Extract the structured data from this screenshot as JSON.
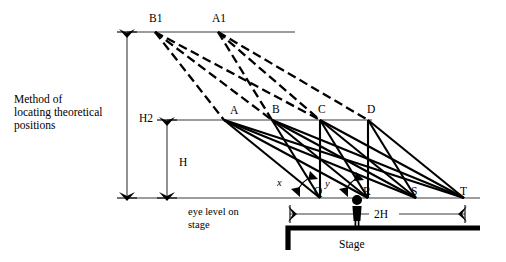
{
  "figure": {
    "caption_lines": [
      "Method of",
      "locating theoretical",
      "positions"
    ],
    "eye_level_lines": [
      "eye level on",
      "stage"
    ],
    "stage_label": "Stage",
    "dimensions": {
      "h2": "H2",
      "h": "H",
      "two_h": "2H"
    },
    "angles": {
      "x": "x",
      "y": "y"
    },
    "source_points": [
      {
        "id": "B1",
        "label": "B1",
        "x": 155,
        "y": 32
      },
      {
        "id": "A1",
        "label": "A1",
        "x": 218,
        "y": 32
      }
    ],
    "mid_points": [
      {
        "id": "A",
        "label": "A",
        "x": 224,
        "y": 120
      },
      {
        "id": "B",
        "label": "B",
        "x": 272,
        "y": 120
      },
      {
        "id": "C",
        "label": "C",
        "x": 320,
        "y": 120
      },
      {
        "id": "D",
        "label": "D",
        "x": 368,
        "y": 120
      }
    ],
    "eye_points": [
      {
        "id": "Q",
        "label": "Q",
        "x": 320,
        "y": 198
      },
      {
        "id": "R",
        "label": "R",
        "x": 368,
        "y": 198
      },
      {
        "id": "S",
        "label": "S",
        "x": 416,
        "y": 198
      },
      {
        "id": "T",
        "label": "T",
        "x": 464,
        "y": 198
      }
    ],
    "dashed_connections": [
      {
        "from": "B1",
        "to": "A"
      },
      {
        "from": "B1",
        "to": "B"
      },
      {
        "from": "B1",
        "to": "C"
      },
      {
        "from": "A1",
        "to": "B"
      },
      {
        "from": "A1",
        "to": "C"
      },
      {
        "from": "A1",
        "to": "D"
      }
    ],
    "solid_connections": [
      {
        "from": "A",
        "to": "Q"
      },
      {
        "from": "A",
        "to": "R"
      },
      {
        "from": "A",
        "to": "S"
      },
      {
        "from": "A",
        "to": "T"
      },
      {
        "from": "B",
        "to": "Q"
      },
      {
        "from": "B",
        "to": "R"
      },
      {
        "from": "B",
        "to": "S"
      },
      {
        "from": "B",
        "to": "T"
      },
      {
        "from": "C",
        "to": "Q"
      },
      {
        "from": "C",
        "to": "R"
      },
      {
        "from": "C",
        "to": "S"
      },
      {
        "from": "C",
        "to": "T"
      },
      {
        "from": "D",
        "to": "Q"
      },
      {
        "from": "D",
        "to": "R"
      },
      {
        "from": "D",
        "to": "S"
      },
      {
        "from": "D",
        "to": "T"
      }
    ],
    "levels": {
      "top_line_y": 32,
      "mid_line_y": 120,
      "eye_line_y": 198,
      "stage_top_y": 228,
      "stage_bottom_y": 250
    },
    "colors": {
      "ink": "#000000",
      "rule": "#3a3a3a",
      "background": "#ffffff"
    }
  }
}
